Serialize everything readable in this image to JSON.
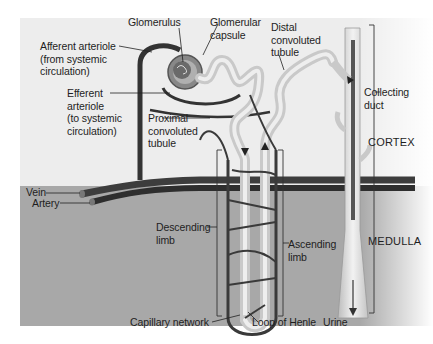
{
  "diagram": {
    "colors": {
      "cortex_bg": "#ededed",
      "medulla_bg": "#a9a9a9",
      "vessel_dark": "#3a3a3a",
      "tubule_light": "#dcdcdc",
      "capsule_mid": "#7a7a7a"
    },
    "labels": {
      "glomerulus": "Glomerulus",
      "glomerular_capsule": "Glomerular\ncapsule",
      "distal_tubule": "Distal\nconvoluted\ntubule",
      "afferent_arteriole": "Afferent arteriole\n(from systemic\ncirculation)",
      "efferent_arteriole": "Efferent\narteriole\n(to systemic\ncirculation)",
      "proximal_tubule": "Proximal\nconvoluted\ntubule",
      "collecting_duct": "Collecting\nduct",
      "vein": "Vein",
      "artery": "Artery",
      "descending_limb": "Descending\nlimb",
      "ascending_limb": "Ascending\nlimb",
      "capillary_network": "Capillary network",
      "loop_of_henle": "Loop of Henle",
      "urine": "Urine"
    },
    "regions": {
      "cortex": "CORTEX",
      "medulla": "MEDULLA"
    }
  }
}
